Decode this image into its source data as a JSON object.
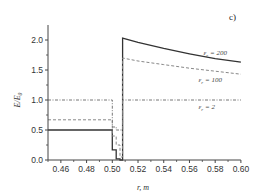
{
  "chart_data": {
    "type": "line",
    "title": "",
    "panel_label": "c)",
    "xlabel": "r, m",
    "ylabel": "E/E0",
    "xlim": [
      0.45,
      0.6
    ],
    "ylim": [
      0.0,
      2.25
    ],
    "grid": false,
    "legend": "inline annotations",
    "x_ticks": [
      "0.46",
      "0.48",
      "0.50",
      "0.52",
      "0.54",
      "0.56",
      "0.58",
      "0.60"
    ],
    "y_ticks": [
      "0.0",
      "0.5",
      "1.0",
      "1.5",
      "2.0"
    ],
    "series": [
      {
        "name": "εr = 200",
        "style": "solid",
        "points": [
          [
            0.45,
            0.5
          ],
          [
            0.5,
            0.5
          ],
          [
            0.5,
            0.17
          ],
          [
            0.503,
            0.17
          ],
          [
            0.503,
            0.02
          ],
          [
            0.506,
            0.02
          ],
          [
            0.506,
            0.0
          ],
          [
            0.508,
            0.0
          ],
          [
            0.508,
            2.03
          ],
          [
            0.52,
            1.96
          ],
          [
            0.54,
            1.86
          ],
          [
            0.56,
            1.77
          ],
          [
            0.58,
            1.69
          ],
          [
            0.6,
            1.63
          ]
        ]
      },
      {
        "name": "εr = 100",
        "style": "dashed",
        "points": [
          [
            0.45,
            0.67
          ],
          [
            0.5,
            0.67
          ],
          [
            0.5,
            0.4
          ],
          [
            0.503,
            0.4
          ],
          [
            0.503,
            0.25
          ],
          [
            0.506,
            0.25
          ],
          [
            0.506,
            0.05
          ],
          [
            0.508,
            0.05
          ],
          [
            0.508,
            1.7
          ],
          [
            0.52,
            1.65
          ],
          [
            0.54,
            1.59
          ],
          [
            0.56,
            1.53
          ],
          [
            0.58,
            1.48
          ],
          [
            0.6,
            1.43
          ]
        ]
      },
      {
        "name": "εr = 2",
        "style": "dash-dot",
        "points": [
          [
            0.45,
            1.0
          ],
          [
            0.5,
            1.0
          ],
          [
            0.5,
            0.55
          ],
          [
            0.503,
            0.55
          ],
          [
            0.503,
            0.5
          ],
          [
            0.508,
            0.5
          ],
          [
            0.508,
            1.0
          ],
          [
            0.6,
            1.0
          ]
        ]
      }
    ],
    "annotations": [
      {
        "text": "εr = 200",
        "x": 0.571,
        "y": 1.75
      },
      {
        "text": "εr = 100",
        "x": 0.567,
        "y": 1.3
      },
      {
        "text": "εr = 2",
        "x": 0.567,
        "y": 0.85
      }
    ]
  }
}
